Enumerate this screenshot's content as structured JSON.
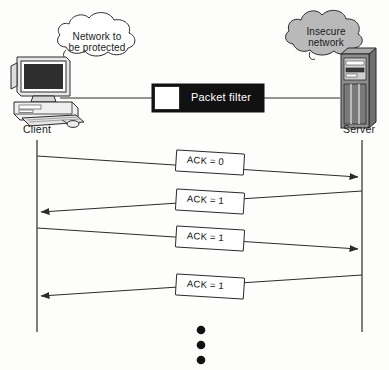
{
  "figure": {
    "background_color": "#fdfdfc",
    "line_color": "#2b2b2b"
  },
  "topology": {
    "client": {
      "label": "Client",
      "icon": "desktop-computer-icon"
    },
    "server": {
      "label": "Server",
      "icon": "server-tower-icon",
      "body_color": "#8d8d8d"
    },
    "packet_filter": {
      "label": "Packet filter",
      "body_color": "#111111",
      "text_color": "#ffffff",
      "port_color": "#ffffff"
    },
    "clouds": [
      {
        "name": "protected-network-cloud",
        "line1": "Network to",
        "line2": "be protected",
        "fill": "#ffffff"
      },
      {
        "name": "insecure-network-cloud",
        "line1": "Insecure",
        "line2": "network",
        "fill": "#b9b9b9"
      }
    ]
  },
  "sequence": {
    "client_lifeline_label": "Client",
    "server_lifeline_label": "Server",
    "messages": [
      {
        "label": "ACK = 0",
        "direction": "client-to-server"
      },
      {
        "label": "ACK = 1",
        "direction": "server-to-client"
      },
      {
        "label": "ACK = 1",
        "direction": "client-to-server"
      },
      {
        "label": "ACK = 1",
        "direction": "server-to-client"
      }
    ],
    "continuation": "vertical-ellipsis",
    "continuation_dots": 3
  }
}
